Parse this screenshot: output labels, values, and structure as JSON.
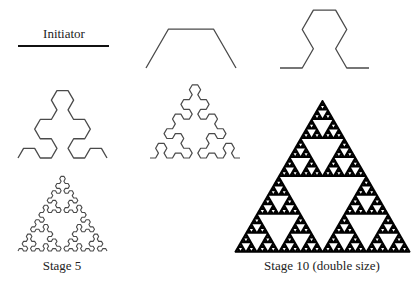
{
  "colors": {
    "background": "#ffffff",
    "stroke": "#4a4a4a",
    "dense_stroke": "#000000",
    "text": "#222222"
  },
  "labels": {
    "initiator": "Initiator",
    "stage5": "Stage 5",
    "stage10": "Stage 10  (double size)"
  },
  "figures": [
    {
      "name": "initiator",
      "stage": 0,
      "x0": 18,
      "x1": 109,
      "y": 46,
      "stroke_width": 1.8
    },
    {
      "name": "stage-1",
      "stage": 1,
      "x0": 146,
      "x1": 236,
      "y": 68,
      "stroke_width": 1.3
    },
    {
      "name": "stage-2",
      "stage": 2,
      "x0": 280,
      "x1": 369,
      "y": 68,
      "stroke_width": 1.3
    },
    {
      "name": "stage-3",
      "stage": 3,
      "x0": 18,
      "x1": 107,
      "y": 158,
      "stroke_width": 1.3
    },
    {
      "name": "stage-4",
      "stage": 4,
      "x0": 150,
      "x1": 240,
      "y": 158,
      "stroke_width": 1.2
    },
    {
      "name": "stage-5",
      "stage": 5,
      "x0": 18,
      "x1": 107,
      "y": 251,
      "stroke_width": 1.1
    },
    {
      "name": "stage-10",
      "stage": 10,
      "x0": 235,
      "x1": 410,
      "y": 252,
      "stroke_width": 1.4
    }
  ],
  "label_positions": {
    "initiator": {
      "x": 64,
      "y": 27,
      "size": 13
    },
    "stage5": {
      "x": 62,
      "y": 259,
      "size": 13
    },
    "stage10": {
      "x": 322,
      "y": 259,
      "size": 13
    }
  }
}
